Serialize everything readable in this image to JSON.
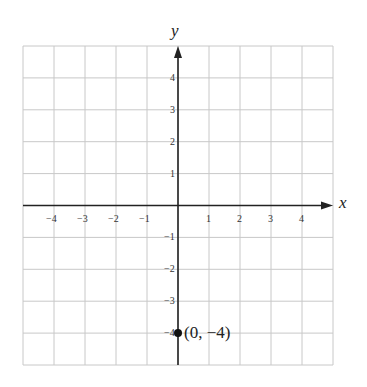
{
  "chart_data": {
    "type": "scatter",
    "title": "",
    "xlabel": "x",
    "ylabel": "y",
    "xlim": [
      -5,
      5
    ],
    "ylim": [
      -5,
      5
    ],
    "grid": true,
    "x_ticks": [
      -4,
      -3,
      -2,
      -1,
      1,
      2,
      3,
      4
    ],
    "y_ticks": [
      4,
      3,
      2,
      1,
      -1,
      -2,
      -3,
      -4
    ],
    "x_tick_labels": [
      "−4",
      "−3",
      "−2",
      "−1",
      "1",
      "2",
      "3",
      "4"
    ],
    "y_tick_labels": [
      "4",
      "3",
      "2",
      "1",
      "−1",
      "−2",
      "−3",
      "−4"
    ],
    "points": [
      {
        "x": 0,
        "y": -4,
        "label": "(0, −4)"
      }
    ]
  },
  "colors": {
    "grid": "#c8c8c8",
    "axis": "#222222",
    "point": "#111111"
  }
}
